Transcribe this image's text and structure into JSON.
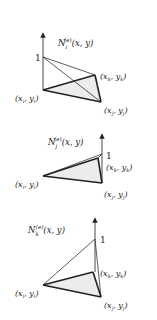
{
  "panels": [
    {
      "function_label": "N",
      "function_sub": "i",
      "function_sup": "(e)",
      "function_args": "(x, y)",
      "peak_label": "1",
      "node_i_label": "(x",
      "node_i_sub": "i",
      "node_i_mid": ", y",
      "node_i_end": ")",
      "node_j_label": "(x",
      "node_j_sub": "j",
      "node_j_mid": ", y",
      "node_j_end": ")",
      "node_k_label": "(x",
      "node_k_sub": "k",
      "node_k_mid": ", y",
      "node_k_end": ")"
    },
    {
      "function_label": "N",
      "function_sub": "j",
      "function_sup": "(e)",
      "function_args": "(x, y)",
      "peak_label": "1",
      "node_i_label": "(x",
      "node_i_sub": "i",
      "node_i_mid": ", y",
      "node_i_end": ")",
      "node_j_label": "(x",
      "node_j_sub": "j",
      "node_j_mid": ", y",
      "node_j_end": ")",
      "node_k_label": "(x",
      "node_k_sub": "k",
      "node_k_mid": ", y",
      "node_k_end": ")"
    },
    {
      "function_label": "N",
      "function_sub": "k",
      "function_sup": "(e)",
      "function_args": "(x, y)",
      "peak_label": "1",
      "node_i_label": "(x",
      "node_i_sub": "i",
      "node_i_mid": ", y",
      "node_i_end": ")",
      "node_j_label": "(x",
      "node_j_sub": "j",
      "node_j_mid": ", y",
      "node_j_end": ")",
      "node_k_label": "(x",
      "node_k_sub": "k",
      "node_k_mid": ", y",
      "node_k_end": ")"
    }
  ]
}
